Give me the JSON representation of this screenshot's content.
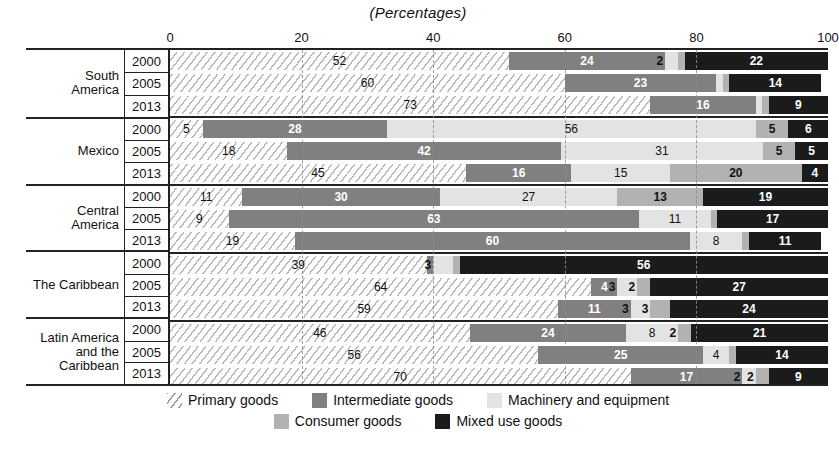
{
  "chart_data": {
    "type": "bar",
    "orientation": "horizontal",
    "stacked": true,
    "title": "(Percentages)",
    "xlabel": "",
    "ylabel": "",
    "xlim": [
      0,
      100
    ],
    "xticks": [
      0,
      20,
      40,
      60,
      80,
      100
    ],
    "grid": true,
    "legend_position": "bottom",
    "series": [
      {
        "name": "Primary goods",
        "color": "#f2f2f2",
        "pattern": "diagonal-hatch"
      },
      {
        "name": "Intermediate goods",
        "color": "#808080",
        "pattern": "solid"
      },
      {
        "name": "Machinery and equipment",
        "color": "#e3e3e3",
        "pattern": "solid"
      },
      {
        "name": "Consumer goods",
        "color": "#b2b2b2",
        "pattern": "solid"
      },
      {
        "name": "Mixed use goods",
        "color": "#1b1b1b",
        "pattern": "solid"
      }
    ],
    "groups": [
      {
        "region": "South America",
        "rows": [
          {
            "year": "2000",
            "values": [
              52,
              24,
              2,
              1,
              22
            ]
          },
          {
            "year": "2005",
            "values": [
              60,
              23,
              1,
              1,
              14
            ]
          },
          {
            "year": "2013",
            "values": [
              73,
              16,
              1,
              1,
              9
            ]
          }
        ]
      },
      {
        "region": "Mexico",
        "rows": [
          {
            "year": "2000",
            "values": [
              5,
              28,
              56,
              5,
              6
            ]
          },
          {
            "year": "2005",
            "values": [
              18,
              42,
              31,
              5,
              5
            ]
          },
          {
            "year": "2013",
            "values": [
              45,
              16,
              15,
              20,
              4
            ]
          }
        ]
      },
      {
        "region": "Central America",
        "rows": [
          {
            "year": "2000",
            "values": [
              11,
              30,
              27,
              13,
              19
            ]
          },
          {
            "year": "2005",
            "values": [
              9,
              63,
              11,
              1,
              17
            ]
          },
          {
            "year": "2013",
            "values": [
              19,
              60,
              8,
              1,
              11
            ]
          }
        ]
      },
      {
        "region": "The Caribbean",
        "rows": [
          {
            "year": "2000",
            "values": [
              39,
              1,
              3,
              1,
              56
            ]
          },
          {
            "year": "2005",
            "values": [
              64,
              4,
              3,
              2,
              27
            ]
          },
          {
            "year": "2013",
            "values": [
              59,
              11,
              3,
              3,
              24
            ]
          }
        ]
      },
      {
        "region": "Latin America and the Caribbean",
        "rows": [
          {
            "year": "2000",
            "values": [
              46,
              24,
              8,
              2,
              21
            ]
          },
          {
            "year": "2005",
            "values": [
              56,
              25,
              4,
              1,
              14
            ]
          },
          {
            "year": "2013",
            "values": [
              70,
              17,
              2,
              2,
              9
            ]
          }
        ]
      }
    ]
  },
  "chart": {
    "title": "(Percentages)",
    "axis": {
      "ticks": [
        "0",
        "20",
        "40",
        "60",
        "80",
        "100"
      ]
    },
    "region_labels": [
      "South America",
      "Mexico",
      "Central America",
      "The Caribbean",
      "Latin America and the Caribbean"
    ],
    "legend": [
      {
        "label": "Primary goods",
        "key": "primary"
      },
      {
        "label": "Intermediate goods",
        "key": "intermediate"
      },
      {
        "label": "Machinery and equipment",
        "key": "machinery"
      },
      {
        "label": "Consumer goods",
        "key": "consumer"
      },
      {
        "label": "Mixed use goods",
        "key": "mixed"
      }
    ]
  }
}
